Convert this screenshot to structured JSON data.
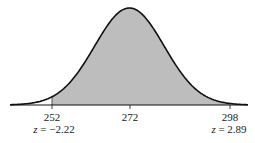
{
  "chart_data": {
    "type": "area",
    "title": "",
    "mean": 272,
    "shaded_range": [
      252,
      298
    ],
    "tick_values": [
      252,
      272,
      298
    ],
    "tick_labels": [
      "252",
      "272",
      "298"
    ],
    "z_labels": [
      "z = −2.22",
      "z = 2.89"
    ],
    "xlabel": "",
    "ylabel": "",
    "grid": false,
    "fill_color": "#bdbdbd",
    "line_color": "#111111"
  },
  "labels": {
    "left_value": "252",
    "center_value": "272",
    "right_value": "298",
    "left_z_prefix": "z",
    "left_z_value": " = −2.22",
    "right_z_prefix": "z",
    "right_z_value": " = 2.89"
  }
}
